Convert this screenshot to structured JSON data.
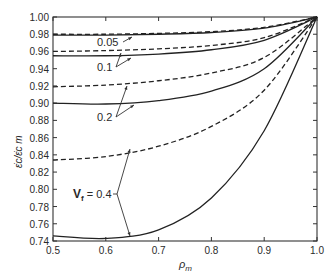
{
  "chart_data": {
    "type": "line",
    "title": "",
    "xlabel": "ρm",
    "ylabel": "ε̇c/ε̇c^m",
    "xlim": [
      0.5,
      1.0
    ],
    "ylim": [
      0.74,
      1.0
    ],
    "grid": false,
    "legend": "none (inline annotations with arrows)",
    "x_ticks": [
      "0.5",
      "0.6",
      "0.7",
      "0.8",
      "0.9",
      "1.0"
    ],
    "y_ticks": [
      "0.74",
      "0.76",
      "0.78",
      "0.80",
      "0.82",
      "0.84",
      "0.86",
      "0.88",
      "0.90",
      "0.92",
      "0.94",
      "0.96",
      "0.98",
      "1.00"
    ],
    "annotations": [
      {
        "text": "0.05",
        "points_to": [
          "Vf=0.05 solid",
          "Vf=0.05 dashed"
        ]
      },
      {
        "text": "0.1",
        "points_to": [
          "Vf=0.1 solid",
          "Vf=0.1 dashed"
        ]
      },
      {
        "text": "0.2",
        "points_to": [
          "Vf=0.2 solid",
          "Vf=0.2 dashed"
        ]
      },
      {
        "text": "Vf = 0.4",
        "points_to": [
          "Vf=0.4 solid",
          "Vf=0.4 dashed"
        ]
      }
    ],
    "x": [
      0.5,
      0.6,
      0.7,
      0.8,
      0.9,
      1.0
    ],
    "series": [
      {
        "name": "Vf=0.05 dashed",
        "style": "dashed",
        "values": [
          0.98,
          0.98,
          0.981,
          0.983,
          0.988,
          1.0
        ]
      },
      {
        "name": "Vf=0.05 solid",
        "style": "solid",
        "values": [
          0.979,
          0.979,
          0.98,
          0.982,
          0.987,
          1.0
        ]
      },
      {
        "name": "Vf=0.1 dashed",
        "style": "dashed",
        "values": [
          0.96,
          0.961,
          0.963,
          0.967,
          0.976,
          1.0
        ]
      },
      {
        "name": "Vf=0.1 solid",
        "style": "solid",
        "values": [
          0.955,
          0.955,
          0.957,
          0.962,
          0.973,
          1.0
        ]
      },
      {
        "name": "Vf=0.2 dashed",
        "style": "dashed",
        "values": [
          0.919,
          0.921,
          0.926,
          0.935,
          0.953,
          1.0
        ]
      },
      {
        "name": "Vf=0.2 solid",
        "style": "solid",
        "values": [
          0.9,
          0.899,
          0.903,
          0.914,
          0.94,
          1.0
        ]
      },
      {
        "name": "Vf=0.4 dashed",
        "style": "dashed",
        "values": [
          0.834,
          0.838,
          0.85,
          0.873,
          0.915,
          1.0
        ]
      },
      {
        "name": "Vf=0.4 solid",
        "style": "solid",
        "values": [
          0.746,
          0.743,
          0.753,
          0.79,
          0.868,
          1.0
        ]
      }
    ]
  },
  "labels": {
    "vf005": "0.05",
    "vf01": "0.1",
    "vf02": "0.2",
    "vf04_prefix": "V",
    "vf04_sub": "f",
    "vf04_value": " = 0.4",
    "xlabel_main": "ρ",
    "xlabel_sub": "m",
    "ylabel": "ε̇c/ε̇c m"
  }
}
